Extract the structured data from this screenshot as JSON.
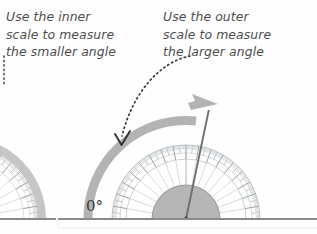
{
  "figure": {
    "background_color": "#fefefe"
  },
  "callouts": {
    "left": {
      "text": "Use the inner\nscale to measure\nthe smaller angle",
      "lines": [
        "Use the inner",
        "scale to measure",
        "the smaller angle"
      ],
      "color": "#4d4d4d",
      "style": "italic"
    },
    "right": {
      "text": "Use the outer\nscale to measure\nthe larger angle",
      "lines": [
        "Use the outer",
        "scale to measure",
        "the larger angle"
      ],
      "color": "#4d4d4d",
      "style": "italic"
    }
  },
  "labels": {
    "zero_degrees": "0°"
  },
  "colors": {
    "text": "#4d4d4d",
    "zero_label": "#3a3a3a",
    "protractor_line": "#b9bfc4",
    "protractor_tick": "#9aa1a8",
    "hub_fill": "#b6b6b6",
    "hub_stroke": "#8f8f8f",
    "band_grey": "#b3b3b3",
    "ray_line": "#6f6f6f",
    "baseline": "#8a8a8a",
    "dotted_pointer": "#3b3b3b"
  },
  "protractors": [
    {
      "name": "left-protractor-partial",
      "center_x": -36,
      "center_y": 219,
      "outer_radius": 82,
      "clipped": true,
      "note": "cut off at left edge of image"
    },
    {
      "name": "right-protractor",
      "center_x": 186,
      "center_y": 219,
      "outer_radius": 82,
      "scale_radius": 74,
      "inner_scale_radius": 60,
      "hub_radius": 34,
      "degrees": [
        0,
        180
      ],
      "tick_interval_minor": 1,
      "tick_interval_major": 10,
      "spoke_interval": 10
    }
  ],
  "ray": {
    "name": "measured-ray",
    "angle_degrees": 72,
    "from_x": 186,
    "from_y": 219,
    "to_x": 212,
    "to_y": 93
  },
  "grey_arrow": {
    "name": "outer-scale-sweep-arrow",
    "description": "thick grey arc arrow sweeping from 0 degrees counterclockwise over the top to the ray",
    "start_angle_degrees": 180,
    "end_angle_degrees": 72,
    "arrow_tip_x": 216,
    "arrow_tip_y": 104
  },
  "pointers": [
    {
      "name": "left-dotted-pointer",
      "style": "dotted",
      "from_x": 4,
      "from_y": 56,
      "to_x": 4,
      "to_y": 84
    },
    {
      "name": "right-dotted-pointer",
      "style": "dotted-curve-with-arrowhead",
      "from_x": 188,
      "from_y": 56,
      "to_x": 121,
      "to_y": 144
    }
  ],
  "baseline": {
    "name": "horizontal-baseline",
    "y": 219,
    "segments": [
      {
        "x1": 0,
        "x2": 56
      },
      {
        "x1": 58,
        "x2": 317
      }
    ]
  }
}
